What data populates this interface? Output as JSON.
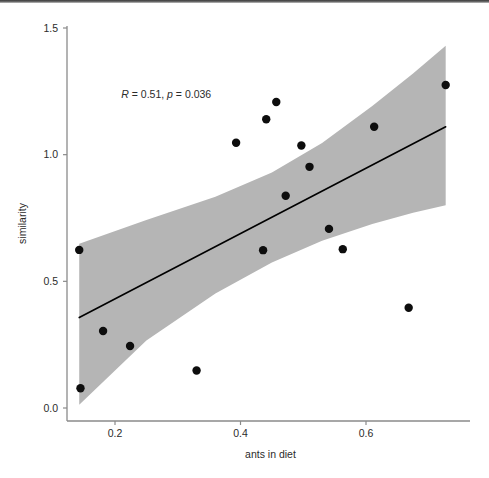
{
  "figure": {
    "name": "ants-in-diet-vs-similarity-scatter",
    "background_color": "#ffffff"
  },
  "chart_data": {
    "type": "scatter",
    "title": "",
    "subtitle": "",
    "xlabel": "ants in diet",
    "ylabel": "similarity",
    "xlim": [
      0.125,
      0.735
    ],
    "ylim": [
      -0.04,
      1.52
    ],
    "xticks": [
      0.2,
      0.4,
      0.6
    ],
    "xtick_labels": [
      "0.2",
      "0.4",
      "0.6"
    ],
    "yticks": [
      0.0,
      0.5,
      1.0,
      1.5
    ],
    "ytick_labels": [
      "0.0",
      "0.5",
      "1.0",
      "1.5"
    ],
    "grid": false,
    "legend": null,
    "annotations": [
      {
        "name": "correlation-stat",
        "text": "R = 0.51, p = 0.036",
        "r_symbol": "R",
        "r_value": "0.51",
        "p_symbol": "p",
        "p_value": "0.036",
        "x": 0.21,
        "y": 1.225
      }
    ],
    "points": [
      {
        "x": 0.143,
        "y": 0.624
      },
      {
        "x": 0.145,
        "y": 0.078
      },
      {
        "x": 0.181,
        "y": 0.304
      },
      {
        "x": 0.224,
        "y": 0.245
      },
      {
        "x": 0.33,
        "y": 0.148
      },
      {
        "x": 0.393,
        "y": 1.047
      },
      {
        "x": 0.436,
        "y": 0.623
      },
      {
        "x": 0.441,
        "y": 1.14
      },
      {
        "x": 0.457,
        "y": 1.208
      },
      {
        "x": 0.472,
        "y": 0.838
      },
      {
        "x": 0.497,
        "y": 1.036
      },
      {
        "x": 0.51,
        "y": 0.952
      },
      {
        "x": 0.541,
        "y": 0.707
      },
      {
        "x": 0.563,
        "y": 0.627
      },
      {
        "x": 0.613,
        "y": 1.11
      },
      {
        "x": 0.668,
        "y": 0.396
      },
      {
        "x": 0.727,
        "y": 1.275
      }
    ],
    "point_style": {
      "marker": "circle",
      "color": "#0d0d0d",
      "size_px": 4.2
    },
    "regression_line": {
      "name": "linear-fit-line",
      "color": "#000000",
      "width_px": 1.6,
      "x_start": 0.143,
      "y_start": 0.357,
      "x_end": 0.727,
      "y_end": 1.11
    },
    "confidence_band": {
      "name": "confidence-interval-band",
      "color": "#b5b5b5",
      "opacity": 1,
      "upper": [
        {
          "x": 0.143,
          "y": 0.648
        },
        {
          "x": 0.25,
          "y": 0.742
        },
        {
          "x": 0.36,
          "y": 0.834
        },
        {
          "x": 0.45,
          "y": 0.93
        },
        {
          "x": 0.53,
          "y": 1.046
        },
        {
          "x": 0.61,
          "y": 1.192
        },
        {
          "x": 0.675,
          "y": 1.32
        },
        {
          "x": 0.727,
          "y": 1.43
        }
      ],
      "lower": [
        {
          "x": 0.143,
          "y": 0.013
        },
        {
          "x": 0.25,
          "y": 0.266
        },
        {
          "x": 0.36,
          "y": 0.452
        },
        {
          "x": 0.45,
          "y": 0.574
        },
        {
          "x": 0.53,
          "y": 0.66
        },
        {
          "x": 0.61,
          "y": 0.726
        },
        {
          "x": 0.675,
          "y": 0.771
        },
        {
          "x": 0.727,
          "y": 0.8
        }
      ]
    },
    "axis_style": {
      "color": "#8a8a8a",
      "tick_length_px": 4
    }
  }
}
